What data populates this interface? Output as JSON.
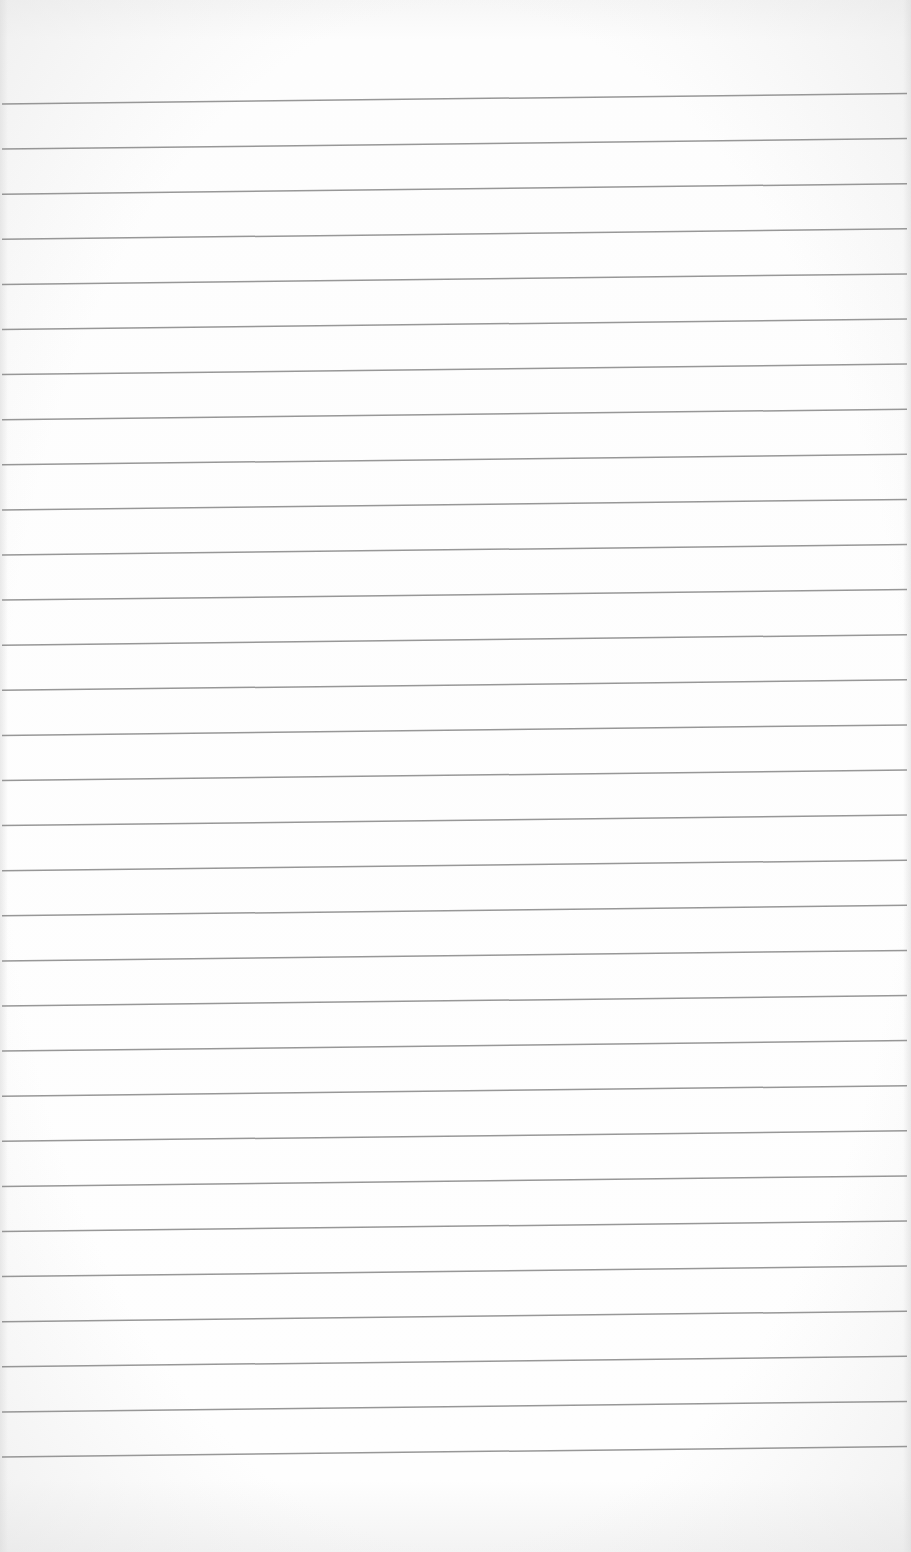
{
  "page": {
    "type": "blank lined paper",
    "background_color": "#fdfdfd",
    "line_color": "#8c8c8c"
  },
  "rules": {
    "count": 31,
    "first_line_left_y": 104,
    "spacing": 45.1,
    "rise_left_to_right": 10.5,
    "stroke_width": 1.5
  }
}
